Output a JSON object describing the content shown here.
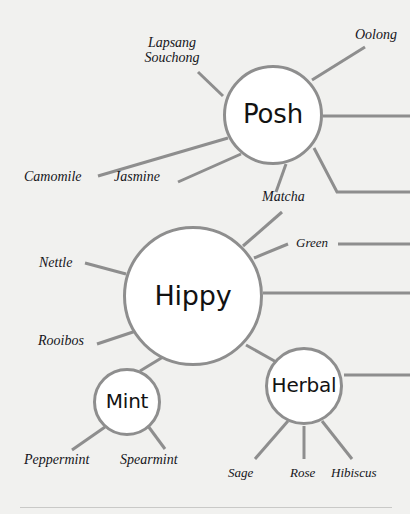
{
  "diagram": {
    "type": "node-link-network",
    "palette": {
      "background": "#f1f1ef",
      "node_fill": "#ffffff",
      "node_stroke": "#8e8e8e",
      "edge_stroke": "#8e8e8e",
      "hub_text": "#121212",
      "leaf_text": "#15151a",
      "rule": "#c9c9c7"
    },
    "hubs": [
      {
        "id": "posh",
        "label": "Posh",
        "cx": 273,
        "cy": 115,
        "r": 50,
        "font_size": 26
      },
      {
        "id": "hippy",
        "label": "Hippy",
        "cx": 193,
        "cy": 296,
        "r": 70,
        "font_size": 27
      },
      {
        "id": "mint",
        "label": "Mint",
        "cx": 127,
        "cy": 402,
        "r": 34,
        "font_size": 20
      },
      {
        "id": "herbal",
        "label": "Herbal",
        "cx": 304,
        "cy": 386,
        "r": 39,
        "font_size": 20
      }
    ],
    "leaves": [
      {
        "id": "lapsang-souchong",
        "label": "Lapsang Souchong",
        "parent": "posh",
        "x": 134,
        "y": 36,
        "width": 76,
        "font_size": 14,
        "two_line": true,
        "align": "center"
      },
      {
        "id": "oolong",
        "label": "Oolong",
        "parent": "posh",
        "x": 355,
        "y": 28,
        "font_size": 14
      },
      {
        "id": "camomile",
        "label": "Camomile",
        "parent": "posh",
        "x": 24,
        "y": 170,
        "font_size": 14
      },
      {
        "id": "jasmine",
        "label": "Jasmine",
        "parent": "posh",
        "x": 114,
        "y": 170,
        "font_size": 14
      },
      {
        "id": "matcha",
        "label": "Matcha",
        "parent": "posh",
        "x": 262,
        "y": 190,
        "font_size": 14
      },
      {
        "id": "green",
        "label": "Green",
        "parent": "hippy",
        "x": 296,
        "y": 236,
        "font_size": 13
      },
      {
        "id": "nettle",
        "label": "Nettle",
        "parent": "hippy",
        "x": 39,
        "y": 256,
        "font_size": 14
      },
      {
        "id": "rooibos",
        "label": "Rooibos",
        "parent": "hippy",
        "x": 38,
        "y": 334,
        "font_size": 14
      },
      {
        "id": "peppermint",
        "label": "Peppermint",
        "parent": "mint",
        "x": 24,
        "y": 453,
        "font_size": 14
      },
      {
        "id": "spearmint",
        "label": "Spearmint",
        "parent": "mint",
        "x": 120,
        "y": 453,
        "font_size": 14
      },
      {
        "id": "sage",
        "label": "Sage",
        "parent": "herbal",
        "x": 228,
        "y": 466,
        "font_size": 13
      },
      {
        "id": "rose",
        "label": "Rose",
        "parent": "herbal",
        "x": 290,
        "y": 466,
        "font_size": 13
      },
      {
        "id": "hibiscus",
        "label": "Hibiscus",
        "parent": "herbal",
        "x": 331,
        "y": 466,
        "font_size": 13
      }
    ],
    "edges": [
      {
        "id": "posh-lapsang",
        "from": "posh",
        "to": "lapsang-souchong",
        "points": "223,96 198,72"
      },
      {
        "id": "posh-oolong",
        "from": "posh",
        "to": "oolong",
        "points": "312,80 365,47"
      },
      {
        "id": "posh-camomile",
        "from": "posh",
        "to": "camomile",
        "points": "228,138 98,176"
      },
      {
        "id": "posh-jasmine",
        "from": "posh",
        "to": "jasmine",
        "points": "241,154 178,182"
      },
      {
        "id": "posh-matcha",
        "from": "posh",
        "to": "matcha",
        "points": "286,164 276,192"
      },
      {
        "id": "posh-right-1",
        "from": "posh",
        "to": "offscreen-right",
        "points": "323,116 410,116"
      },
      {
        "id": "posh-right-2",
        "from": "posh",
        "to": "offscreen-right",
        "points": "314,148 337,192 410,192"
      },
      {
        "id": "hippy-matcha",
        "from": "hippy",
        "to": "matcha",
        "points": "243,246 282,212"
      },
      {
        "id": "hippy-green",
        "from": "hippy",
        "to": "green",
        "points": "254,258 288,244"
      },
      {
        "id": "green-right",
        "from": "green",
        "to": "offscreen-right",
        "points": "338,244 410,244"
      },
      {
        "id": "hippy-right",
        "from": "hippy",
        "to": "offscreen-right",
        "points": "263,293 410,293"
      },
      {
        "id": "hippy-nettle",
        "from": "hippy",
        "to": "nettle",
        "points": "126,274 85,263"
      },
      {
        "id": "hippy-rooibos",
        "from": "hippy",
        "to": "rooibos",
        "points": "136,331 97,344"
      },
      {
        "id": "hippy-mint",
        "from": "hippy",
        "to": "mint",
        "points": "163,357 140,371"
      },
      {
        "id": "hippy-herbal",
        "from": "hippy",
        "to": "herbal",
        "points": "246,345 278,363"
      },
      {
        "id": "mint-peppermint",
        "from": "mint",
        "to": "peppermint",
        "points": "105,427 72,450"
      },
      {
        "id": "mint-spearmint",
        "from": "mint",
        "to": "spearmint",
        "points": "148,426 165,449"
      },
      {
        "id": "herbal-sage",
        "from": "herbal",
        "to": "sage",
        "points": "288,421 255,459"
      },
      {
        "id": "herbal-rose",
        "from": "herbal",
        "to": "rose",
        "points": "304,426 304,459"
      },
      {
        "id": "herbal-hibiscus",
        "from": "herbal",
        "to": "hibiscus",
        "points": "322,421 352,459"
      },
      {
        "id": "herbal-right",
        "from": "herbal",
        "to": "offscreen-right",
        "points": "344,375 410,375"
      }
    ],
    "footer_rule": {
      "x": 20,
      "y": 507,
      "width": 372
    }
  }
}
